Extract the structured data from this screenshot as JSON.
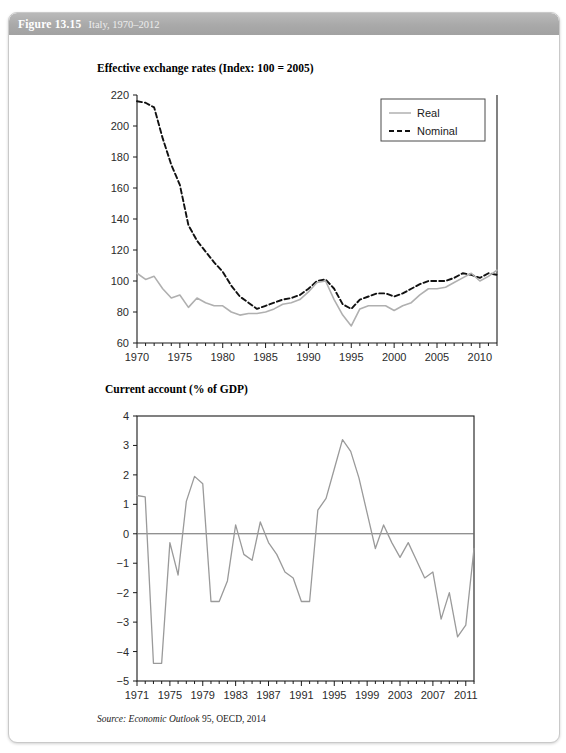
{
  "header": {
    "figure_number": "Figure 13.15",
    "caption": "Italy, 1970–2012"
  },
  "source_note": {
    "prefix": "Source:",
    "italic_part": "Economic Outlook",
    "rest": " 95, OECD, 2014"
  },
  "panel1": {
    "title": "Effective exchange rates (Index: 100 = 2005)"
  },
  "panel2": {
    "title": "Current account (% of GDP)"
  },
  "chart_data": [
    {
      "type": "line",
      "title": "Effective exchange rates (Index: 100 = 2005)",
      "xlabel": "",
      "ylabel": "",
      "xlim": [
        1970,
        2012
      ],
      "ylim": [
        60,
        220
      ],
      "yticks": [
        60,
        80,
        100,
        120,
        140,
        160,
        180,
        200,
        220
      ],
      "xticks": [
        1970,
        1975,
        1980,
        1985,
        1990,
        1995,
        2000,
        2005,
        2010
      ],
      "xminorstep": 1,
      "grid": false,
      "legend_position": "top-right",
      "colors": {
        "real": "#b0b0b0",
        "nominal": "#111111"
      },
      "x": [
        1970,
        1971,
        1972,
        1973,
        1974,
        1975,
        1976,
        1977,
        1978,
        1979,
        1980,
        1981,
        1982,
        1983,
        1984,
        1985,
        1986,
        1987,
        1988,
        1989,
        1990,
        1991,
        1992,
        1993,
        1994,
        1995,
        1996,
        1997,
        1998,
        1999,
        2000,
        2001,
        2002,
        2003,
        2004,
        2005,
        2006,
        2007,
        2008,
        2009,
        2010,
        2011,
        2012
      ],
      "series": [
        {
          "name": "Nominal",
          "style": "dashed",
          "color": "#111111",
          "values": [
            216,
            215,
            212,
            192,
            175,
            162,
            136,
            126,
            119,
            112,
            106,
            97,
            90,
            86,
            82,
            84,
            86,
            88,
            89,
            91,
            95,
            100,
            101,
            95,
            85,
            82,
            88,
            90,
            92,
            92,
            90,
            92,
            95,
            98,
            100,
            100,
            100,
            102,
            105,
            104,
            102,
            105,
            104
          ]
        },
        {
          "name": "Real",
          "style": "solid",
          "color": "#b0b0b0",
          "values": [
            105,
            101,
            103,
            95,
            89,
            91,
            83,
            89,
            86,
            84,
            84,
            80,
            78,
            79,
            79,
            80,
            82,
            85,
            86,
            88,
            93,
            99,
            100,
            88,
            78,
            71,
            82,
            84,
            84,
            84,
            81,
            84,
            86,
            91,
            95,
            95,
            96,
            99,
            102,
            105,
            100,
            103,
            107
          ]
        }
      ]
    },
    {
      "type": "line",
      "title": "Current account (% of GDP)",
      "xlabel": "",
      "ylabel": "",
      "xlim": [
        1971,
        2012
      ],
      "ylim": [
        -5,
        4
      ],
      "yticks": [
        -5,
        -4,
        -3,
        -2,
        -1,
        0,
        1,
        2,
        3,
        4
      ],
      "xticks": [
        1971,
        1975,
        1979,
        1983,
        1987,
        1991,
        1995,
        1999,
        2003,
        2007,
        2011
      ],
      "xminorstep": 1,
      "grid": false,
      "zero_line": true,
      "colors": {
        "line": "#9a9a9a",
        "zero": "#6a6a6a"
      },
      "x": [
        1971,
        1972,
        1973,
        1974,
        1975,
        1976,
        1977,
        1978,
        1979,
        1980,
        1981,
        1982,
        1983,
        1984,
        1985,
        1986,
        1987,
        1988,
        1989,
        1990,
        1991,
        1992,
        1993,
        1994,
        1995,
        1996,
        1997,
        1998,
        1999,
        2000,
        2001,
        2002,
        2003,
        2004,
        2005,
        2006,
        2007,
        2008,
        2009,
        2010,
        2011,
        2012
      ],
      "series": [
        {
          "name": "Current account",
          "style": "solid",
          "color": "#9a9a9a",
          "values": [
            1.3,
            1.25,
            -4.4,
            -4.4,
            -0.3,
            -1.4,
            1.1,
            1.95,
            1.7,
            -2.3,
            -2.3,
            -1.6,
            0.3,
            -0.7,
            -0.9,
            0.4,
            -0.3,
            -0.7,
            -1.3,
            -1.5,
            -2.3,
            -2.3,
            0.8,
            1.2,
            2.2,
            3.2,
            2.8,
            1.9,
            0.7,
            -0.5,
            0.3,
            -0.3,
            -0.8,
            -0.3,
            -0.9,
            -1.5,
            -1.3,
            -2.9,
            -2.0,
            -3.5,
            -3.1,
            -0.5
          ]
        }
      ]
    }
  ]
}
